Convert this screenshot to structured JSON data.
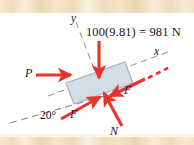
{
  "figure": {
    "kind": "free-body-diagram"
  },
  "labels": {
    "weight": "100(9.81) = 981 N",
    "axis_y": "y",
    "axis_x": "x",
    "force_p": "P",
    "friction_right": "F",
    "friction_left": "F",
    "normal": "N",
    "incline_angle": "20°"
  },
  "colors": {
    "arrow_red": "#e8342a",
    "block_fill": "#d3dde6",
    "block_stroke": "#8a9aa8",
    "dashed_gray": "#8d8d8d",
    "band_beige": "#f2e2c2",
    "text": "#1a1a1a"
  },
  "geometry": {
    "incline_angle_deg": 20,
    "block_center": {
      "x": 97,
      "y": 77
    },
    "weight_arrow": {
      "x": 99,
      "y_start": 41,
      "y_end": 79
    }
  }
}
